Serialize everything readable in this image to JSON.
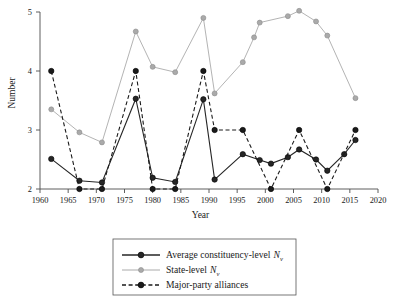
{
  "figure": {
    "background": "#ffffff",
    "ylabel": "Number",
    "xlabel": "Year"
  },
  "axes": {
    "x_ticks": [
      "1960",
      "1965",
      "1970",
      "1975",
      "1980",
      "1985",
      "1990",
      "1995",
      "2000",
      "2005",
      "2010",
      "2015",
      "2020"
    ],
    "y_ticks": [
      "2",
      "3",
      "4",
      "5"
    ],
    "xlim": [
      1960,
      2020
    ],
    "ylim": [
      2,
      5
    ]
  },
  "legend": {
    "items": [
      {
        "label": "Average constituency-level",
        "symbol": "N",
        "subscript": "v",
        "style": "solid",
        "color": "#262626",
        "marker": "filled-circle"
      },
      {
        "label": "State-level",
        "symbol": "N",
        "subscript": "v",
        "style": "solid",
        "color": "#aaaaaa",
        "marker": "filled-circle"
      },
      {
        "label": "Major-party alliances",
        "symbol": "",
        "subscript": "",
        "style": "dashed",
        "color": "#1a1a1a",
        "marker": "filled-circle"
      }
    ]
  },
  "chart_data": {
    "type": "line",
    "title": "",
    "xlabel": "Year",
    "ylabel": "Number",
    "xlim": [
      1960,
      2020
    ],
    "ylim": [
      2,
      5
    ],
    "grid": false,
    "legend_position": "bottom-center",
    "x": [
      1962,
      1967,
      1971,
      1977,
      1980,
      1984,
      1989,
      1991,
      1996,
      1998,
      1999,
      2001,
      2004,
      2006,
      2009,
      2011,
      2014,
      2016
    ],
    "series": [
      {
        "name": "Average constituency-level Nv",
        "color": "#262626",
        "style": "solid",
        "x": [
          1962,
          1967,
          1971,
          1977,
          1980,
          1984,
          1989,
          1991,
          1996,
          1999,
          2001,
          2004,
          2006,
          2009,
          2011,
          2014,
          2016
        ],
        "values": [
          2.51,
          2.14,
          2.11,
          3.53,
          2.19,
          2.12,
          3.52,
          2.16,
          2.59,
          2.49,
          2.43,
          2.54,
          2.67,
          2.5,
          2.31,
          2.59,
          2.83
        ]
      },
      {
        "name": "State-level Nv",
        "color": "#aaaaaa",
        "style": "solid",
        "x": [
          1962,
          1967,
          1971,
          1977,
          1980,
          1984,
          1989,
          1991,
          1996,
          1998,
          1999,
          2004,
          2006,
          2009,
          2011,
          2016
        ],
        "values": [
          3.35,
          2.96,
          2.79,
          4.67,
          4.07,
          3.98,
          4.9,
          3.62,
          4.15,
          4.57,
          4.82,
          4.93,
          5.02,
          4.84,
          4.6,
          3.54
        ]
      },
      {
        "name": "Major-party alliances",
        "color": "#1a1a1a",
        "style": "dashed",
        "x": [
          1962,
          1967,
          1971,
          1977,
          1980,
          1984,
          1989,
          1991,
          1996,
          2001,
          2006,
          2011,
          2016
        ],
        "values": [
          4.0,
          2.0,
          2.0,
          4.0,
          2.0,
          2.0,
          4.0,
          3.0,
          3.0,
          2.0,
          3.0,
          2.0,
          3.0
        ]
      }
    ]
  }
}
